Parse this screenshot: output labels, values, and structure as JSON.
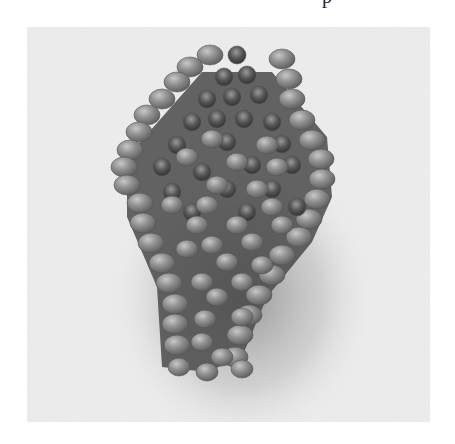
{
  "caption_fragment": "p",
  "photo": {
    "subject": "Beaded leaf made of seed beads in brick/peyote stitch, photographed in grayscale on a white textured cloth",
    "palette": {
      "background": "#eeeeee",
      "background_light": "#f7f7f7",
      "shadow": "#9a9a9a",
      "opaque_bead": "#8c8c8c",
      "opaque_bead_highlight": "#c8c8c8",
      "opaque_bead_shade": "#5e5e5e",
      "transparent_bead": "#4a4a4a",
      "transparent_bead_highlight": "#9a9a9a",
      "thread": "#3a3a3a"
    }
  }
}
